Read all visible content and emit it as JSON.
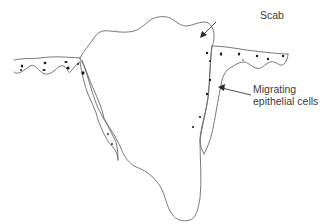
{
  "diagram": {
    "labels": {
      "scab": "Scab",
      "migrating_line1": "Migrating",
      "migrating_line2": "epithelial cells"
    },
    "colors": {
      "outline": "#6a6a6a",
      "cells": "#1a1a1a",
      "text": "#3c3c3c",
      "background": "#ffffff"
    }
  }
}
